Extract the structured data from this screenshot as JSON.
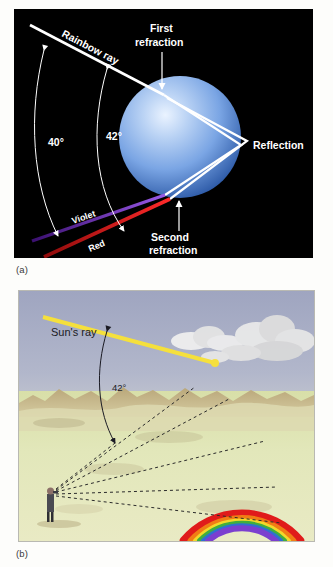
{
  "figure": {
    "panel_a": {
      "caption": "(a)",
      "background_color": "#000000",
      "labels": {
        "rainbow_ray": "Rainbow ray",
        "first_refraction_line1": "First",
        "first_refraction_line2": "refraction",
        "reflection": "Reflection",
        "second_refraction_line1": "Second",
        "second_refraction_line2": "refraction",
        "angle_40": "40°",
        "angle_42": "42°",
        "violet": "Violet",
        "red": "Red"
      },
      "colors": {
        "droplet_fill": "#6f9ce0",
        "droplet_highlight": "#e9f2ff",
        "ray": "#ffffff",
        "violet_ray": "#7b3fcf",
        "red_ray": "#e31b1b",
        "label_text": "#ffffff"
      }
    },
    "panel_b": {
      "caption": "(b)",
      "labels": {
        "suns_ray": "Sun's ray",
        "angle_42": "42°"
      },
      "colors": {
        "sky": "#a9aec6",
        "ground": "#dde5b6",
        "hills": "#c8b68a",
        "sun_ray": "#f5e03c",
        "sight_lines": "#2b2b2b",
        "cloud": "#e8e8e8",
        "observer": "#4a4a52"
      },
      "rainbow_bands": [
        "#e01b1b",
        "#f07d15",
        "#f2d82a",
        "#3fae3f",
        "#2f6fd0",
        "#7b3fcf"
      ]
    }
  }
}
